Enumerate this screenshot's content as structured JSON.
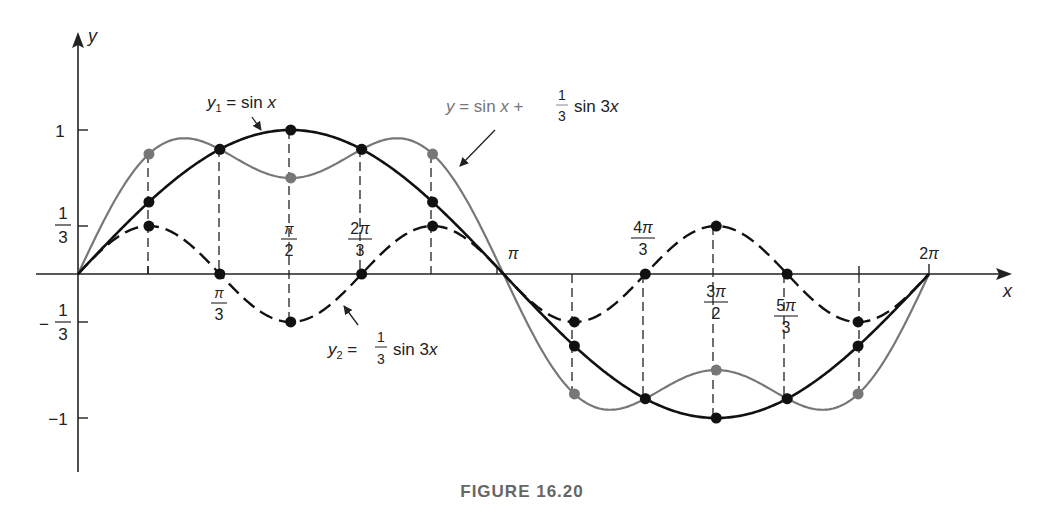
{
  "figure": {
    "caption": "FIGURE 16.20",
    "axis_x_label": "x",
    "axis_y_label": "y",
    "curve_labels": {
      "y1": "y₁ = sin x",
      "y2": "y₂ = ⅓ sin 3x",
      "sum": "y = sin x + ⅓ sin 3x"
    },
    "x_ticks": [
      {
        "label": "π/3",
        "num": "π",
        "den": "3",
        "value": 1.0472
      },
      {
        "label": "π/2",
        "num": "π",
        "den": "2",
        "value": 1.5708
      },
      {
        "label": "2π/3",
        "num": "2π",
        "den": "3",
        "value": 2.0944
      },
      {
        "label": "π",
        "value": 3.1416
      },
      {
        "label": "4π/3",
        "num": "4π",
        "den": "3",
        "value": 4.1888
      },
      {
        "label": "3π/2",
        "num": "3π",
        "den": "2",
        "value": 4.7124
      },
      {
        "label": "5π/3",
        "num": "5π",
        "den": "3",
        "value": 5.236
      },
      {
        "label": "2π",
        "value": 6.2832
      }
    ],
    "y_ticks": [
      {
        "label": "1",
        "value": 1
      },
      {
        "label": "1/3",
        "value": 0.3333
      },
      {
        "label": "-1/3",
        "value": -0.3333
      },
      {
        "label": "-1",
        "value": -1
      }
    ]
  },
  "chart_data": {
    "type": "line",
    "title": "FIGURE 16.20",
    "xlabel": "x",
    "ylabel": "y",
    "xlim": [
      0,
      6.2832
    ],
    "ylim": [
      -1.35,
      1.35
    ],
    "grid": false,
    "x_tick_labels": [
      "π/3",
      "π/2",
      "2π/3",
      "π",
      "4π/3",
      "3π/2",
      "5π/3",
      "2π"
    ],
    "y_tick_labels": [
      "1",
      "1/3",
      "-1/3",
      "-1"
    ],
    "x": [
      "0",
      "π/6",
      "π/3",
      "π/2",
      "2π/3",
      "5π/6",
      "π",
      "7π/6",
      "4π/3",
      "3π/2",
      "5π/3",
      "11π/6",
      "2π"
    ],
    "series": [
      {
        "name": "y1 = sin x",
        "style": "solid black",
        "values": [
          0,
          0.5,
          0.866,
          1,
          0.866,
          0.5,
          0,
          -0.5,
          -0.866,
          -1,
          -0.866,
          -0.5,
          0
        ]
      },
      {
        "name": "y2 = (1/3) sin 3x",
        "style": "dashed black",
        "values": [
          0,
          0.333,
          0,
          -0.333,
          0,
          0.333,
          0,
          -0.333,
          0,
          0.333,
          0,
          -0.333,
          0
        ]
      },
      {
        "name": "y = sin x + (1/3) sin 3x",
        "style": "solid gray",
        "values": [
          0,
          0.833,
          0.866,
          0.667,
          0.866,
          0.833,
          0,
          -0.833,
          -0.866,
          -0.667,
          -0.866,
          -0.833,
          0
        ]
      }
    ],
    "annotations": [
      "y1 = sin x",
      "y2 = (1/3) sin 3x",
      "y = sin x + (1/3) sin 3x"
    ]
  }
}
